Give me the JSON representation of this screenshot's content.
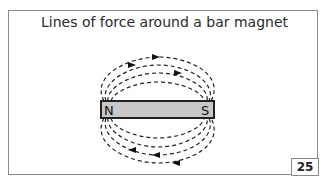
{
  "title": "Lines of force around a bar magnet",
  "magnet": {
    "north_label": "N",
    "south_label": "S",
    "fill": "#c8c8c8",
    "stroke": "#222222"
  },
  "page_number": "25"
}
